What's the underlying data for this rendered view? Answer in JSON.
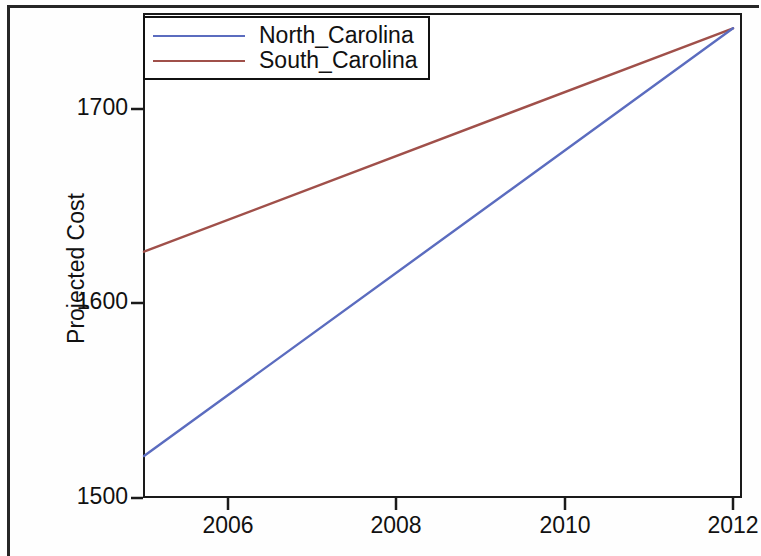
{
  "figure": {
    "background_color": "#ffffff",
    "frame_color": "#1a1a1a"
  },
  "chart_data": {
    "type": "line",
    "title": "",
    "subtitle": "",
    "xlabel": "",
    "ylabel": "Projected Cost",
    "xlim": [
      2005,
      2012
    ],
    "ylim": [
      1496,
      1750
    ],
    "xticks": [
      2006,
      2008,
      2010,
      2012
    ],
    "yticks": [
      1500,
      1600,
      1700
    ],
    "xtick_labels": [
      "2006",
      "2008",
      "2010",
      "2012"
    ],
    "ytick_labels": [
      "1500",
      "1600",
      "1700"
    ],
    "grid": false,
    "legend_position": "top-left",
    "x": [
      2005,
      2012
    ],
    "series": [
      {
        "name": "North_Carolina",
        "color": "#5b6cbf",
        "values": [
          1518,
          1742
        ]
      },
      {
        "name": "South_Carolina",
        "color": "#a0504a",
        "values": [
          1625,
          1742
        ]
      }
    ],
    "annotations": []
  },
  "legend": {
    "entries": [
      {
        "label": "North_Carolina",
        "color": "#5b6cbf"
      },
      {
        "label": "South_Carolina",
        "color": "#a0504a"
      }
    ]
  },
  "axes": {
    "y_axis_title": "Projected Cost",
    "y_tick_1": "1700",
    "y_tick_2": "1600",
    "y_tick_3": "1500",
    "x_tick_1": "2006",
    "x_tick_2": "2008",
    "x_tick_3": "2010",
    "x_tick_4": "2012"
  }
}
